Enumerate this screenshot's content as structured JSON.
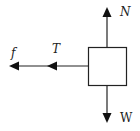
{
  "diagram": {
    "type": "free-body diagram",
    "colors": {
      "stroke": "#222222",
      "background": "#ffffff"
    },
    "object": {
      "shape": "square block"
    },
    "forces": [
      {
        "label": "N",
        "direction": "up"
      },
      {
        "label": "W",
        "direction": "down"
      },
      {
        "label": "T",
        "direction": "left"
      },
      {
        "label": "f",
        "direction": "left"
      }
    ]
  }
}
